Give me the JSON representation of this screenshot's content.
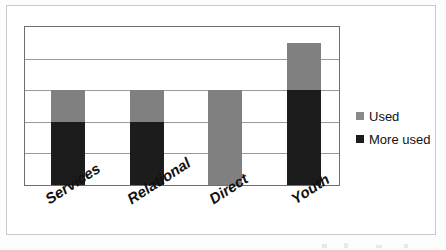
{
  "chart_data": {
    "type": "bar",
    "subtype": "stacked-bar",
    "title": "",
    "xlabel": "",
    "ylabel": "",
    "categories": [
      "Services",
      "Relational",
      "Direct",
      "Youth"
    ],
    "series": [
      {
        "name": "More used",
        "color": "#1c1c1c",
        "values": [
          2.0,
          2.0,
          0.0,
          3.0
        ]
      },
      {
        "name": "Used",
        "color": "#808080",
        "values": [
          1.0,
          1.0,
          3.0,
          1.5
        ]
      }
    ],
    "totals": [
      3.0,
      3.0,
      3.0,
      4.5
    ],
    "ylim": [
      0,
      5
    ],
    "yticks": [
      0,
      1,
      2,
      3,
      4,
      5
    ],
    "ytick_labels": [
      "",
      "",
      "",
      "",
      "",
      ""
    ],
    "grid": true,
    "grid_lines": 5,
    "legend_position": "right",
    "stacking_order": [
      "More used",
      "Used"
    ]
  },
  "legend": {
    "items": [
      {
        "label": "Used",
        "color": "#808080",
        "swatch": "square-swatch"
      },
      {
        "label": "More used",
        "color": "#1c1c1c",
        "swatch": "square-swatch"
      }
    ]
  },
  "axis": {
    "categories": [
      "Services",
      "Relational",
      "Direct",
      "Youth"
    ]
  },
  "colors": {
    "used": "#808080",
    "more_used": "#1c1c1c",
    "gridline": "#9a9a9a",
    "axis_border": "#6e6e6e",
    "page_border": "#c9c9c9",
    "background": "#ffffff"
  }
}
